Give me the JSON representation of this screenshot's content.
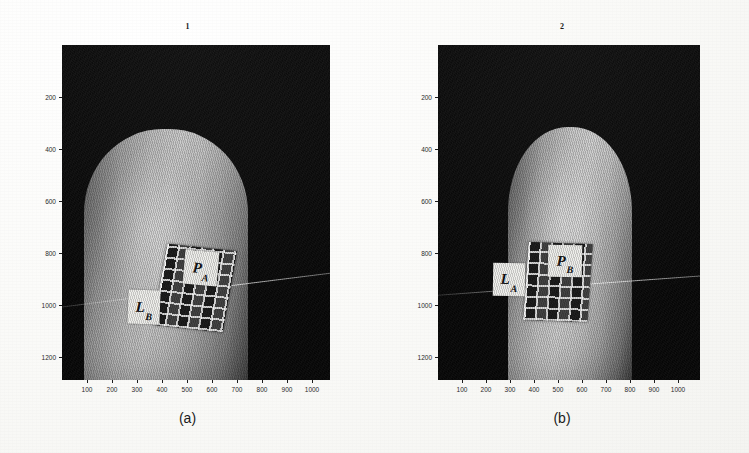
{
  "figure": {
    "panels": [
      {
        "id": "a",
        "caption": "(a)",
        "title": "1",
        "axes": {
          "x_ticks": [
            "100",
            "200",
            "300",
            "400",
            "500",
            "600",
            "700",
            "800",
            "900",
            "1000"
          ],
          "y_ticks": [
            "200",
            "400",
            "600",
            "800",
            "1000",
            "1200"
          ],
          "x_range": [
            0,
            1060
          ],
          "y_range": [
            0,
            1280
          ]
        },
        "image": {
          "kind": "grayscale-fingertip-photograph",
          "background_color": "#0a0a0a",
          "finger_color": "#bdbdbd"
        },
        "annotations": [
          {
            "name": "light-label",
            "base": "L",
            "sub": "B"
          },
          {
            "name": "pattern-label",
            "base": "P",
            "sub": "A"
          }
        ]
      },
      {
        "id": "b",
        "caption": "(b)",
        "title": "2",
        "axes": {
          "x_ticks": [
            "100",
            "200",
            "300",
            "400",
            "500",
            "600",
            "700",
            "800",
            "900",
            "1000"
          ],
          "y_ticks": [
            "200",
            "400",
            "600",
            "800",
            "1000",
            "1200"
          ],
          "x_range": [
            0,
            1060
          ],
          "y_range": [
            0,
            1280
          ]
        },
        "image": {
          "kind": "grayscale-fingertip-photograph",
          "background_color": "#0a0a0a",
          "finger_color": "#c2c2c2"
        },
        "annotations": [
          {
            "name": "light-label",
            "base": "L",
            "sub": "A"
          },
          {
            "name": "pattern-label",
            "base": "P",
            "sub": "B"
          }
        ]
      }
    ]
  }
}
